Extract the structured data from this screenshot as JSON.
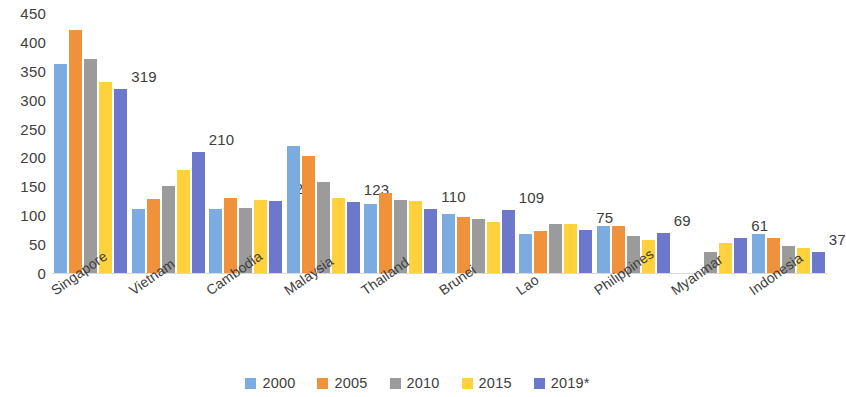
{
  "chart_data": {
    "type": "bar",
    "title": "",
    "subtitle": "",
    "xlabel": "",
    "ylabel": "",
    "ylim": [
      0,
      450
    ],
    "ytick_step": 50,
    "yticks": [
      "450",
      "400",
      "350",
      "300",
      "250",
      "200",
      "150",
      "100",
      "50",
      "0"
    ],
    "grid": false,
    "legend_position": "bottom",
    "categories": [
      "Singapore",
      "Vietnam",
      "Cambodia",
      "Malaysia",
      "Thailand",
      "Brunei",
      "Lao",
      "Philippines",
      "Myanmar",
      "Indonesia"
    ],
    "series": [
      {
        "name": "2000",
        "color": "#7cabe0",
        "values": [
          362,
          110,
          110,
          220,
          120,
          103,
          67,
          82,
          null,
          68
        ]
      },
      {
        "name": "2005",
        "color": "#f0913c",
        "values": [
          420,
          128,
          130,
          203,
          138,
          97,
          72,
          82,
          null,
          61
        ]
      },
      {
        "name": "2010",
        "color": "#9b9b9b",
        "values": [
          370,
          150,
          113,
          157,
          127,
          93,
          84,
          64,
          36,
          46
        ]
      },
      {
        "name": "2015",
        "color": "#ffd23d",
        "values": [
          330,
          178,
          126,
          130,
          124,
          88,
          85,
          57,
          52,
          43
        ]
      },
      {
        "name": "2019*",
        "color": "#6d78cc",
        "values": [
          319,
          210,
          124,
          123,
          110,
          109,
          75,
          69,
          61,
          37
        ]
      }
    ],
    "data_labels": {
      "series": "2019*",
      "values": [
        "319",
        "210",
        "124",
        "123",
        "110",
        "109",
        "75",
        "69",
        "61",
        "37"
      ]
    }
  },
  "legend": {
    "items": [
      {
        "label": "2000",
        "color": "#7cabe0"
      },
      {
        "label": "2005",
        "color": "#f0913c"
      },
      {
        "label": "2010",
        "color": "#9b9b9b"
      },
      {
        "label": "2015",
        "color": "#ffd23d"
      },
      {
        "label": "2019*",
        "color": "#6d78cc"
      }
    ]
  }
}
